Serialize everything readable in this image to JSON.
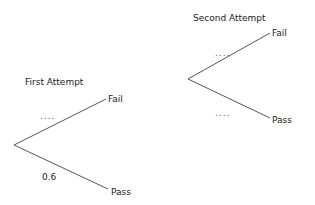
{
  "diagram": {
    "type": "probability-tree",
    "first_attempt": {
      "title": "First Attempt",
      "branches": [
        {
          "outcome": "Fail",
          "probability_label": "...."
        },
        {
          "outcome": "Pass",
          "probability_label": "0.6"
        }
      ]
    },
    "second_attempt": {
      "title": "Second Attempt",
      "branches": [
        {
          "outcome": "Fail",
          "probability_label": "...."
        },
        {
          "outcome": "Pass",
          "probability_label": "...."
        }
      ]
    },
    "line_color": "#555555"
  }
}
